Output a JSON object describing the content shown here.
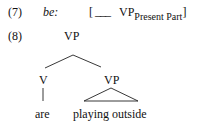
{
  "example7": {
    "number": "(7)",
    "word": "be:",
    "bracket_open": "[",
    "blank": "___",
    "category": "VP",
    "subscript": "Present Part",
    "bracket_close": "]"
  },
  "example8": {
    "number": "(8)",
    "tree": {
      "root": "VP",
      "left_node": "V",
      "left_leaf": "are",
      "right_node": "VP",
      "right_leaf": "playing outside"
    }
  }
}
